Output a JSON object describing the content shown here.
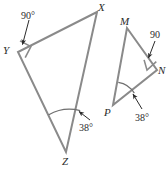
{
  "figure": {
    "background_color": "#ffffff",
    "stroke_color": "#8a8a8a",
    "annotation_color": "#2b2b2b",
    "width": 168,
    "height": 171
  },
  "triangles": [
    {
      "name": "triangle-xyz",
      "vertices": [
        {
          "label": "X",
          "x": 97,
          "y": 12
        },
        {
          "label": "Y",
          "x": 18,
          "y": 52
        },
        {
          "label": "Z",
          "x": 66,
          "y": 152
        }
      ],
      "right_angle_at": "Y",
      "marked_angle_at": "Z"
    },
    {
      "name": "triangle-mnp",
      "vertices": [
        {
          "label": "M",
          "x": 127,
          "y": 28
        },
        {
          "label": "N",
          "x": 157,
          "y": 70
        },
        {
          "label": "P",
          "x": 113,
          "y": 105
        }
      ],
      "right_angle_at": "N",
      "marked_angle_at": "P"
    }
  ],
  "vertex_labels": [
    {
      "name": "vertex-label-x",
      "text": "X",
      "x": 98,
      "y": 2
    },
    {
      "name": "vertex-label-y",
      "text": "Y",
      "x": 3,
      "y": 45
    },
    {
      "name": "vertex-label-z",
      "text": "Z",
      "x": 62,
      "y": 156
    },
    {
      "name": "vertex-label-m",
      "text": "M",
      "x": 120,
      "y": 16
    },
    {
      "name": "vertex-label-n",
      "text": "N",
      "x": 158,
      "y": 65
    },
    {
      "name": "vertex-label-p",
      "text": "P",
      "x": 104,
      "y": 107
    }
  ],
  "angle_labels": [
    {
      "name": "angle-label-y-90",
      "text": "90°",
      "x": 21,
      "y": 11
    },
    {
      "name": "angle-label-z-38",
      "text": "38°",
      "x": 79,
      "y": 123
    },
    {
      "name": "angle-label-n-90",
      "text": "90",
      "x": 150,
      "y": 30
    },
    {
      "name": "angle-label-p-38",
      "text": "38°",
      "x": 135,
      "y": 113
    }
  ]
}
